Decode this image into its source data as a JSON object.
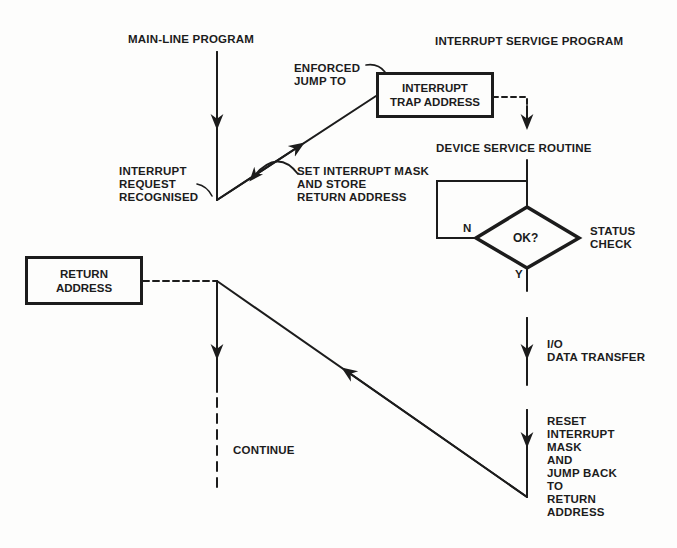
{
  "diagram": {
    "type": "flowchart",
    "colors": {
      "ink": "#1c1c1c",
      "paper": "#fdfdfc"
    },
    "headings": {
      "main_line": "MAIN-LINE PROGRAM",
      "service": "INTERRUPT SERVIGE PROGRAM"
    },
    "nodes": {
      "trap_box": "INTERRUPT\nTRAP ADDRESS",
      "return_box": "RETURN\nADDRESS",
      "decision": "OK?"
    },
    "labels": {
      "enforced_jump": "ENFORCED\nJUMP TO",
      "interrupt_request": "INTERRUPT\nREQUEST\nRECOGNISED",
      "set_mask": "SET INTERRUPT MASK\nAND STORE\nRETURN ADDRESS",
      "device_service": "DEVICE SERVICE ROUTINE",
      "status_check": "STATUS\nCHECK",
      "branch_no": "N",
      "branch_yes": "Y",
      "io_transfer": "I/O\nDATA TRANSFER",
      "reset_mask": "RESET\nINTERRUPT\nMASK\nAND\nJUMP BACK\nTO\nRETURN\nADDRESS",
      "continue": "CONTINUE"
    },
    "edges": [
      {
        "from": "main-line",
        "to": "interrupt-request",
        "style": "solid"
      },
      {
        "from": "interrupt-request",
        "to": "trap_box",
        "style": "solid",
        "label": "enforced_jump"
      },
      {
        "from": "trap_box",
        "to": "device_service",
        "style": "dashed"
      },
      {
        "from": "device_service",
        "to": "decision",
        "style": "solid"
      },
      {
        "from": "decision",
        "to": "device_service",
        "style": "solid",
        "label": "N"
      },
      {
        "from": "decision",
        "to": "io_transfer",
        "style": "solid",
        "label": "Y"
      },
      {
        "from": "io_transfer",
        "to": "reset_mask",
        "style": "solid"
      },
      {
        "from": "reset_mask",
        "to": "return-point",
        "style": "solid"
      },
      {
        "from": "return_box",
        "to": "return-point",
        "style": "dashed"
      },
      {
        "from": "return-point",
        "to": "continue",
        "style": "solid-then-dashed"
      }
    ]
  }
}
